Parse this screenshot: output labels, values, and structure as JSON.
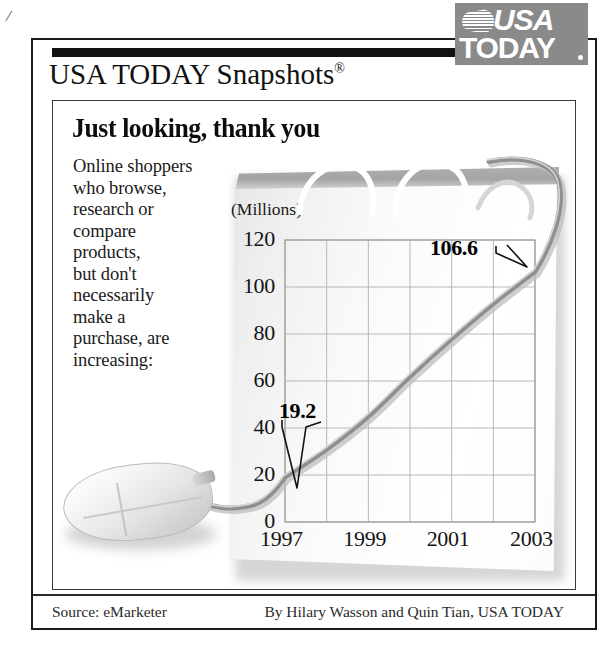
{
  "brand": {
    "logo_usa": "USA",
    "logo_today": "TODAY",
    "masthead_title": "USA TODAY Snapshots",
    "masthead_registered": "®"
  },
  "headline": "Just looking, thank you",
  "deck_lines": [
    "Online shoppers",
    "who browse,",
    "research or",
    "compare",
    "products,",
    "but don't",
    "necessarily",
    "make a",
    "purchase, are",
    "increasing:"
  ],
  "footer": {
    "source": "Source: eMarketer",
    "credit": "By Hilary Wasson and Quin Tian, USA TODAY"
  },
  "illustration": {
    "mouse": "computer-mouse",
    "cord": "mouse-cord-becomes-data-line"
  },
  "chart_data": {
    "type": "line",
    "title": "Just looking, thank you",
    "subtitle": "Online shoppers who browse, research or compare products, but don't necessarily make a purchase, are increasing:",
    "xlabel": "",
    "ylabel": "(Millions)",
    "units_label": "(Millions)",
    "x": [
      1997,
      1998,
      1999,
      2000,
      2001,
      2002,
      2003
    ],
    "categories": [
      "1997",
      "1998",
      "1999",
      "2000",
      "2001",
      "2002",
      "2003"
    ],
    "values": [
      19.2,
      31.0,
      45.0,
      62.0,
      78.0,
      93.0,
      106.6
    ],
    "xticks": [
      "1997",
      "1999",
      "2001",
      "2003"
    ],
    "xtick_values": [
      1997,
      1999,
      2001,
      2003
    ],
    "yticks": [
      "0",
      "20",
      "40",
      "60",
      "80",
      "100",
      "120"
    ],
    "ytick_values": [
      0,
      20,
      40,
      60,
      80,
      100,
      120
    ],
    "xlim": [
      1997,
      2003
    ],
    "ylim": [
      0,
      120
    ],
    "grid": true,
    "legend": false,
    "annotations": [
      {
        "label": "19.2",
        "x": 1997,
        "y": 19.2
      },
      {
        "label": "106.6",
        "x": 2003,
        "y": 106.6
      }
    ],
    "source": "eMarketer"
  }
}
